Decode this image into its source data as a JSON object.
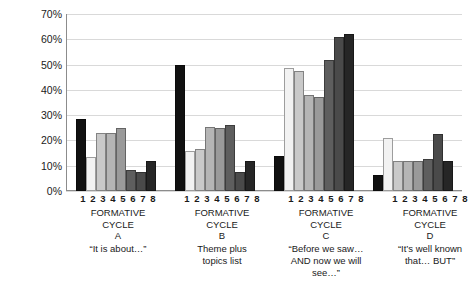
{
  "chart_data": {
    "type": "bar",
    "title": "",
    "xlabel": "",
    "ylabel": "Percentage of teachers",
    "ylim": [
      0,
      70
    ],
    "ytick_labels": [
      "0%",
      "10%",
      "20%",
      "30%",
      "40%",
      "50%",
      "60%",
      "70%"
    ],
    "ytick_values": [
      0,
      10,
      20,
      30,
      40,
      50,
      60,
      70
    ],
    "grid": true,
    "legend": "none",
    "categories": [
      "1",
      "2",
      "3",
      "4",
      "5",
      "6",
      "7",
      "8"
    ],
    "groups": [
      {
        "id": "A",
        "heading_line1": "FORMATIVE",
        "heading_line2": "CYCLE",
        "heading_line3": "A",
        "description": [
          "“It is about…”"
        ],
        "values": [
          28.5,
          13.5,
          23,
          23,
          25,
          8.5,
          7.5,
          12
        ]
      },
      {
        "id": "B",
        "heading_line1": "FORMATIVE",
        "heading_line2": "CYCLE",
        "heading_line3": "B",
        "description": [
          "Theme plus",
          "topics list"
        ],
        "values": [
          50,
          16,
          16.5,
          25.5,
          25,
          26,
          7.5,
          12
        ]
      },
      {
        "id": "C",
        "heading_line1": "FORMATIVE",
        "heading_line2": "CYCLE",
        "heading_line3": "C",
        "description": [
          "“Before we saw…",
          "AND now we will",
          "see…”"
        ],
        "values": [
          14,
          48.5,
          47.5,
          38,
          37,
          52,
          61,
          62
        ]
      },
      {
        "id": "D",
        "heading_line1": "FORMATIVE",
        "heading_line2": "CYCLE",
        "heading_line3": "D",
        "description": [
          "“It’s well known",
          "that… BUT”"
        ],
        "values": [
          6.5,
          21,
          12,
          12,
          12,
          12.5,
          22.5,
          12
        ]
      }
    ],
    "bar_colors": [
      "#111111",
      "#f2f2f2",
      "#c9c9c9",
      "#b5b5b5",
      "#9a9a9a",
      "#5e5e5e",
      "#4a4a4a",
      "#262626"
    ],
    "grid_color": "#d9d9d9",
    "axis_color": "#8c8c8c",
    "background": "#ffffff"
  }
}
